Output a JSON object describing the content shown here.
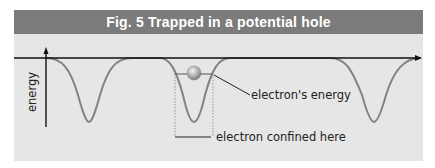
{
  "figure": {
    "title": "Fig. 5 Trapped in a potential hole",
    "y_axis_label": "energy",
    "annotations": {
      "electron_energy": "electron's energy",
      "confined": "electron confined here"
    },
    "colors": {
      "panel_bg": "#e6e6e6",
      "title_bg": "#7b7b7b",
      "title_text": "#ffffff",
      "curve": "#808080",
      "axis": "#111111",
      "electron": "#a8a8a8"
    },
    "wells": [
      {
        "center_x": 89,
        "bottom_y": 122
      },
      {
        "center_x": 194,
        "bottom_y": 122
      },
      {
        "center_x": 374,
        "bottom_y": 122
      }
    ]
  }
}
